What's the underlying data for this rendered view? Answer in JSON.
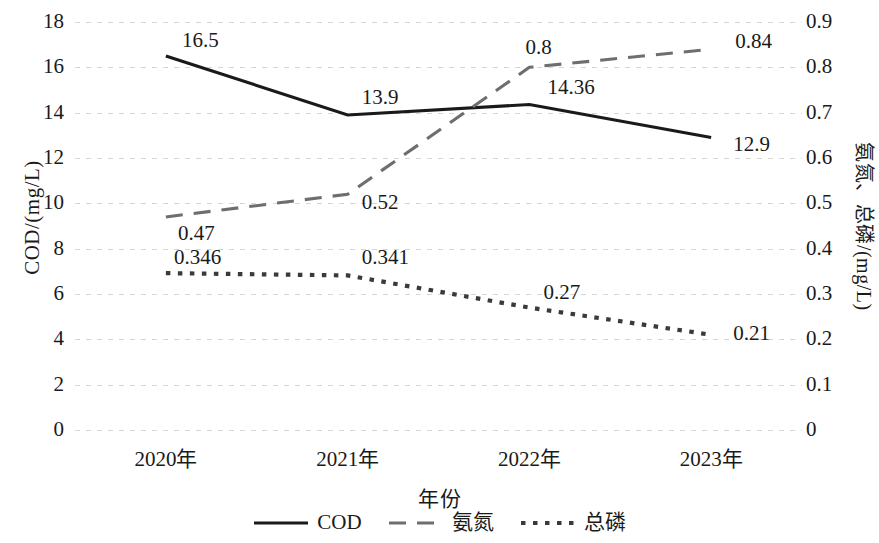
{
  "chart_data": {
    "type": "line",
    "title": "",
    "xlabel": "年份",
    "ylabel": "COD/(mg/L)",
    "y2label": "氨氮、总磷/(mg/L)",
    "categories": [
      "2020年",
      "2021年",
      "2022年",
      "2023年"
    ],
    "ylim": [
      0,
      18
    ],
    "y2lim": [
      0,
      0.9
    ],
    "yticks": [
      "18",
      "16",
      "14",
      "12",
      "10",
      "8",
      "6",
      "4",
      "2",
      "0"
    ],
    "ytick_values": [
      18,
      16,
      14,
      12,
      10,
      8,
      6,
      4,
      2,
      0
    ],
    "y2ticks": [
      "0.9",
      "0.8",
      "0.7",
      "0.6",
      "0.5",
      "0.4",
      "0.3",
      "0.2",
      "0.1",
      "0"
    ],
    "y2tick_values": [
      0.9,
      0.8,
      0.7,
      0.6,
      0.5,
      0.4,
      0.3,
      0.2,
      0.1,
      0
    ],
    "grid": true,
    "legend_position": "bottom",
    "series": [
      {
        "name": "COD",
        "axis": "left",
        "style": "solid",
        "color": "#1a1a1a",
        "values": [
          16.5,
          13.9,
          14.36,
          12.9
        ],
        "labels": [
          "16.5",
          "13.9",
          "14.36",
          "12.9"
        ]
      },
      {
        "name": "氨氮",
        "axis": "right",
        "style": "dashed",
        "color": "#6e6e6e",
        "values": [
          0.47,
          0.52,
          0.8,
          0.84
        ],
        "labels": [
          "0.47",
          "0.52",
          "0.8",
          "0.84"
        ]
      },
      {
        "name": "总磷",
        "axis": "right",
        "style": "dotted",
        "color": "#3a3a3a",
        "values": [
          0.346,
          0.341,
          0.27,
          0.21
        ],
        "labels": [
          "0.346",
          "0.341",
          "0.27",
          "0.21"
        ]
      }
    ]
  },
  "legend": {
    "items": [
      {
        "label": "COD",
        "style": "solid",
        "color": "#1a1a1a"
      },
      {
        "label": "氨氮",
        "style": "dashed",
        "color": "#6e6e6e"
      },
      {
        "label": "总磷",
        "style": "dotted",
        "color": "#3a3a3a"
      }
    ]
  }
}
